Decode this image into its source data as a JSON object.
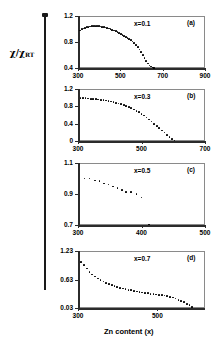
{
  "figure": {
    "ylabel": "χ/χ",
    "ylabel_sub": "RT",
    "xlabel": "Zn content (x)"
  },
  "chart_data": [
    {
      "type": "scatter",
      "panel": "(a)",
      "series_label": "x=0.1",
      "title": "",
      "xlabel": "",
      "ylabel": "χ/χRT",
      "xlim": [
        300,
        900
      ],
      "ylim": [
        0.4,
        1.2
      ],
      "xticks": [
        300,
        500,
        700,
        900
      ],
      "yticks": [
        0.4,
        0.8,
        1.2
      ],
      "grid": false,
      "x": [
        310,
        318,
        326,
        334,
        342,
        350,
        358,
        366,
        374,
        382,
        390,
        398,
        406,
        414,
        422,
        430,
        438,
        446,
        454,
        462,
        470,
        478,
        486,
        494,
        502,
        510,
        518,
        526,
        534,
        542,
        550,
        558,
        566,
        574,
        582,
        590,
        598,
        606,
        614,
        622,
        630,
        638,
        646,
        654,
        660
      ],
      "y": [
        0.975,
        0.995,
        1.008,
        1.018,
        1.026,
        1.032,
        1.038,
        1.041,
        1.043,
        1.044,
        1.043,
        1.041,
        1.038,
        1.034,
        1.029,
        1.023,
        1.016,
        1.008,
        0.999,
        0.989,
        0.978,
        0.966,
        0.953,
        0.939,
        0.925,
        0.91,
        0.895,
        0.879,
        0.862,
        0.845,
        0.827,
        0.806,
        0.782,
        0.754,
        0.722,
        0.686,
        0.646,
        0.603,
        0.558,
        0.512,
        0.47,
        0.44,
        0.421,
        0.409,
        0.402
      ]
    },
    {
      "type": "scatter",
      "panel": "(b)",
      "series_label": "x=0.3",
      "title": "",
      "xlabel": "",
      "ylabel": "χ/χRT",
      "xlim": [
        300,
        700
      ],
      "ylim": [
        0,
        1.2
      ],
      "xticks": [
        300,
        500,
        700
      ],
      "yticks": [
        0,
        0.4,
        0.8,
        1.2
      ],
      "grid": false,
      "x": [
        308,
        316,
        324,
        332,
        340,
        348,
        356,
        364,
        372,
        380,
        388,
        396,
        404,
        412,
        420,
        428,
        436,
        444,
        452,
        460,
        468,
        476,
        484,
        492,
        500,
        508,
        516,
        524,
        532,
        540,
        548,
        556,
        564,
        572,
        580,
        588,
        596,
        604
      ],
      "y": [
        0.99,
        0.988,
        0.985,
        0.981,
        0.977,
        0.972,
        0.966,
        0.96,
        0.952,
        0.944,
        0.934,
        0.923,
        0.911,
        0.898,
        0.883,
        0.867,
        0.849,
        0.829,
        0.807,
        0.783,
        0.757,
        0.728,
        0.697,
        0.663,
        0.626,
        0.586,
        0.543,
        0.497,
        0.449,
        0.399,
        0.348,
        0.296,
        0.245,
        0.195,
        0.146,
        0.098,
        0.05,
        0.01
      ]
    },
    {
      "type": "scatter",
      "panel": "(c)",
      "series_label": "x=0.5",
      "title": "",
      "xlabel": "",
      "ylabel": "χ/χRT",
      "xlim": [
        300,
        500
      ],
      "ylim": [
        0.7,
        1.1
      ],
      "xticks": [
        300,
        400,
        500
      ],
      "yticks": [
        0.7,
        0.9,
        1.1
      ],
      "grid": false,
      "x": [
        310,
        318,
        327,
        334,
        341,
        348,
        355,
        362,
        369,
        376,
        383,
        392,
        400,
        412
      ],
      "y": [
        1.0,
        0.999,
        0.987,
        0.982,
        0.968,
        0.961,
        0.948,
        0.94,
        0.927,
        0.915,
        0.915,
        0.901,
        0.877,
        0.703
      ]
    },
    {
      "type": "scatter",
      "panel": "(d)",
      "series_label": "x=0.7",
      "title": "",
      "xlabel": "Zn content (x)",
      "ylabel": "χ/χRT",
      "xlim": [
        300,
        620
      ],
      "ylim": [
        0.03,
        1.23
      ],
      "xticks": [
        300,
        500
      ],
      "yticks": [
        0.03,
        0.63,
        1.23
      ],
      "grid": false,
      "x": [
        308,
        315,
        322,
        329,
        336,
        343,
        350,
        357,
        364,
        371,
        378,
        385,
        392,
        399,
        406,
        413,
        420,
        427,
        434,
        441,
        448,
        455,
        462,
        469,
        476,
        483,
        490,
        497,
        504,
        511,
        518,
        525,
        532,
        539,
        546,
        553,
        560,
        567,
        574,
        581,
        588
      ],
      "y": [
        1.0,
        0.93,
        0.86,
        0.79,
        0.735,
        0.69,
        0.65,
        0.615,
        0.585,
        0.56,
        0.535,
        0.513,
        0.493,
        0.475,
        0.458,
        0.443,
        0.428,
        0.415,
        0.402,
        0.39,
        0.379,
        0.368,
        0.358,
        0.348,
        0.339,
        0.33,
        0.322,
        0.314,
        0.306,
        0.299,
        0.292,
        0.282,
        0.268,
        0.25,
        0.228,
        0.204,
        0.178,
        0.15,
        0.12,
        0.088,
        0.055
      ]
    }
  ]
}
